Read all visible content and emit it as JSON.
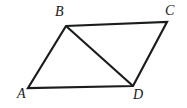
{
  "figure": {
    "kind": "geometry-diagram",
    "shape_name": "parallelogram",
    "background_color": "#ffffff",
    "stroke_color": "#1a1c1e",
    "stroke_width": 2.2,
    "canvas": {
      "width": 187,
      "height": 108
    },
    "vertices": [
      {
        "id": "A",
        "label": "A",
        "x": 28,
        "y": 88,
        "label_x": 17,
        "label_y": 87
      },
      {
        "id": "B",
        "label": "B",
        "x": 66,
        "y": 26,
        "label_x": 55,
        "label_y": 5
      },
      {
        "id": "C",
        "label": "C",
        "x": 167,
        "y": 22,
        "label_x": 165,
        "label_y": 4
      },
      {
        "id": "D",
        "label": "D",
        "x": 133,
        "y": 86,
        "label_x": 133,
        "label_y": 88
      }
    ],
    "edges": [
      {
        "id": "AB",
        "from": "A",
        "to": "B",
        "type": "side"
      },
      {
        "id": "BC",
        "from": "B",
        "to": "C",
        "type": "side"
      },
      {
        "id": "CD",
        "from": "C",
        "to": "D",
        "type": "side"
      },
      {
        "id": "DA",
        "from": "D",
        "to": "A",
        "type": "side"
      },
      {
        "id": "BD",
        "from": "B",
        "to": "D",
        "type": "diagonal"
      }
    ],
    "outline_points": "28,88 66,26 167,22 133,86",
    "diagonal_points": "66,26 133,86",
    "labels": {
      "A": "A",
      "B": "B",
      "C": "C",
      "D": "D"
    }
  }
}
